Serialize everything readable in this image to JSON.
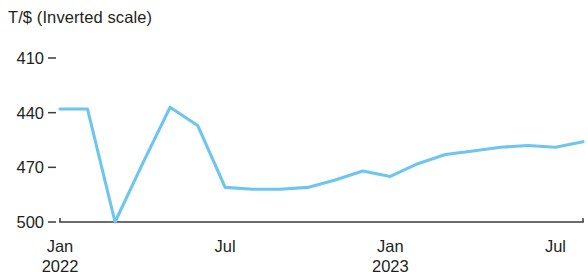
{
  "chart_data": {
    "type": "line",
    "title": "T/$ (Inverted scale)",
    "subtitle": "",
    "xlabel": "",
    "ylabel": "T/$ (Inverted scale)",
    "inverted_y_axis": true,
    "grid": false,
    "legend": "none",
    "line_color": "#6ec6ef",
    "axis_color": "#3b3b3b",
    "y_ticks": [
      410,
      440,
      470,
      500
    ],
    "ylim": [
      410,
      500
    ],
    "x_ticks": [
      {
        "label": "Jan",
        "sublabel": "2022",
        "x": "2022-01"
      },
      {
        "label": "Jul",
        "sublabel": "",
        "x": "2022-07"
      },
      {
        "label": "Jan",
        "sublabel": "2023",
        "x": "2023-01"
      },
      {
        "label": "Jul",
        "sublabel": "",
        "x": "2023-07"
      }
    ],
    "x": [
      "2022-01",
      "2022-02",
      "2022-03",
      "2022-04",
      "2022-05",
      "2022-06",
      "2022-07",
      "2022-08",
      "2022-09",
      "2022-10",
      "2022-11",
      "2022-12",
      "2023-01",
      "2023-02",
      "2023-03",
      "2023-04",
      "2023-05",
      "2023-06",
      "2023-07",
      "2023-08"
    ],
    "series": [
      {
        "name": "Turkish lira per US dollar",
        "color": "#6ec6ef",
        "values": [
          438,
          438,
          500,
          468,
          437,
          447,
          481,
          482,
          482,
          481,
          477,
          472,
          475,
          468,
          463,
          461,
          459,
          458,
          459,
          456
        ]
      }
    ]
  }
}
